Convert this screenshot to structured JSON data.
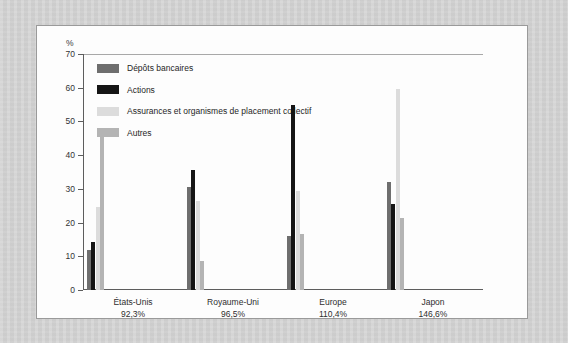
{
  "figure": {
    "y_unit_label": "%"
  },
  "legend": {
    "items": [
      {
        "label": "Dépôts bancaires",
        "color": "#6e6e6e"
      },
      {
        "label": "Actions",
        "color": "#151515"
      },
      {
        "label": "Assurances et organismes de placement collectif",
        "color": "#dcdcdc"
      },
      {
        "label": "Autres",
        "color": "#b4b4b4"
      }
    ]
  },
  "chart_data": {
    "type": "bar",
    "title": "",
    "xlabel": "",
    "ylabel": "%",
    "ylim": [
      0,
      70
    ],
    "yticks": [
      0,
      10,
      20,
      30,
      40,
      50,
      60,
      70
    ],
    "ytick_labels": [
      "0",
      "10",
      "20",
      "30",
      "40",
      "50",
      "60",
      "70"
    ],
    "grid": false,
    "legend_position": "inside-top-left",
    "categories": [
      "États-Unis",
      "Royaume-Uni",
      "Europe",
      "Japon"
    ],
    "category_sublabels": [
      "92,3%",
      "96,5%",
      "110,4%",
      "146,6%"
    ],
    "series": [
      {
        "name": "Dépôts bancaires",
        "color": "#6e6e6e",
        "values": [
          12,
          30.5,
          16,
          32
        ]
      },
      {
        "name": "Actions",
        "color": "#151515",
        "values": [
          14.3,
          35.5,
          55,
          25.5
        ]
      },
      {
        "name": "Assurances et organismes de placement collectif",
        "color": "#dcdcdc",
        "values": [
          24.5,
          26.5,
          29.5,
          59.5
        ]
      },
      {
        "name": "Autres",
        "color": "#b4b4b4",
        "values": [
          45.5,
          8.5,
          16.5,
          21.5
        ]
      }
    ]
  }
}
